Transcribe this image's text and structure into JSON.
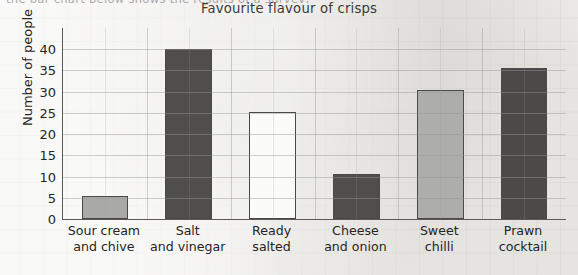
{
  "clipped_header_text": "the bar chart below shows the results of a survey,",
  "chart_data": {
    "type": "bar",
    "title": "Favourite flavour of crisps",
    "xlabel": "",
    "ylabel": "Number of people",
    "ylim": [
      0,
      45
    ],
    "ytick_values": [
      0,
      5,
      10,
      15,
      20,
      25,
      30,
      35,
      40
    ],
    "ytick_labels": [
      "0",
      "5",
      "10",
      "15",
      "20",
      "25",
      "30",
      "35",
      "40"
    ],
    "grid": true,
    "legend": "none",
    "categories": [
      "Sour cream and chive",
      "Salt and vinegar",
      "Ready salted",
      "Cheese and onion",
      "Sweet chilli",
      "Prawn cocktail"
    ],
    "category_lines": [
      [
        "Sour cream",
        "and chive"
      ],
      [
        "Salt",
        "and vinegar"
      ],
      [
        "Ready",
        "salted"
      ],
      [
        "Cheese",
        "and onion"
      ],
      [
        "Sweet",
        "chilli"
      ],
      [
        "Prawn",
        "cocktail"
      ]
    ],
    "values": [
      5.5,
      40,
      25.3,
      10.5,
      30.5,
      35.5
    ],
    "bar_colors": [
      "#a9a9a7",
      "#4f4e4c",
      "#fbfbfa",
      "#4f4e4c",
      "#adadaa",
      "#4b4a48"
    ],
    "bar_edge_color": "#4a4945"
  },
  "colors": {
    "page_background": "#f2f1ee",
    "axis": "#5a5955",
    "grid": "#96969a",
    "text": "#26251f",
    "title_text": "#3a3936"
  }
}
